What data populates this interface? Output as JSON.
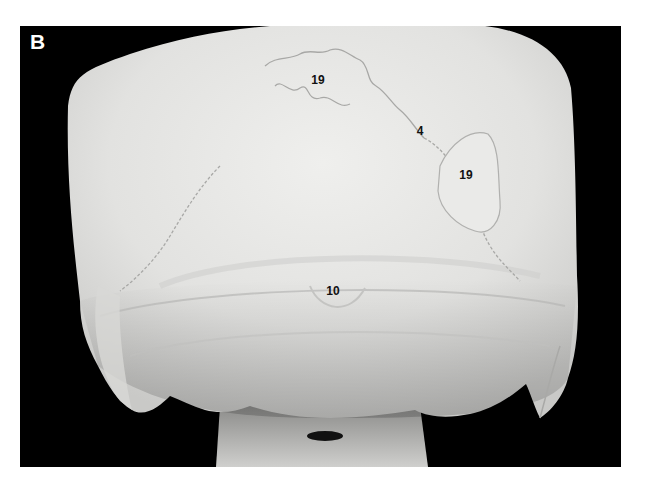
{
  "figure": {
    "panel_letter": "B",
    "colors": {
      "page_background": "#ffffff",
      "plate_background": "#000000",
      "bone": "#e6e6e4",
      "bone_shadow": "#bdbdbb",
      "label_text": "#111111",
      "panel_letter_text": "#ffffff"
    }
  },
  "labels": [
    {
      "id": "label-19-upper",
      "text": "19",
      "x": 318,
      "y": 80
    },
    {
      "id": "label-4",
      "text": "4",
      "x": 420,
      "y": 131
    },
    {
      "id": "label-19-right",
      "text": "19",
      "x": 466,
      "y": 175
    },
    {
      "id": "label-10",
      "text": "10",
      "x": 333,
      "y": 291
    }
  ]
}
